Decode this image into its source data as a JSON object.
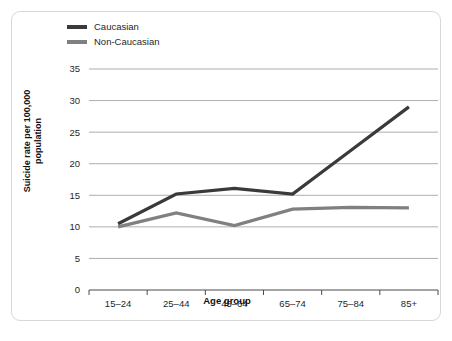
{
  "chart_data": {
    "type": "line",
    "title": "",
    "xlabel": "Age group",
    "ylabel": "Suicide rate per 100,000 population",
    "categories": [
      "15–24",
      "25–44",
      "45–64",
      "65–74",
      "75–84",
      "85+"
    ],
    "yticks": [
      0,
      5,
      10,
      15,
      20,
      25,
      30,
      35
    ],
    "ylim": [
      0,
      35
    ],
    "grid": "horizontal",
    "legend_position": "top-left",
    "series": [
      {
        "name": "Caucasian",
        "color": "#3a3a3a",
        "values": [
          10.5,
          15.2,
          16.1,
          15.2,
          22.1,
          29.0
        ]
      },
      {
        "name": "Non-Caucasian",
        "color": "#808080",
        "values": [
          10.0,
          12.2,
          10.2,
          12.8,
          13.1,
          13.0
        ]
      }
    ]
  },
  "ylabel_lines": {
    "line1": "Suicide rate per 100,000",
    "line2": "population"
  },
  "caption": {
    "text": ""
  },
  "colors": {
    "caucasian": "#3a3a3a",
    "non_caucasian": "#808080",
    "gridline": "#8a8a8a",
    "axis": "#4a4a4a",
    "card_border": "#d8d8d8"
  }
}
